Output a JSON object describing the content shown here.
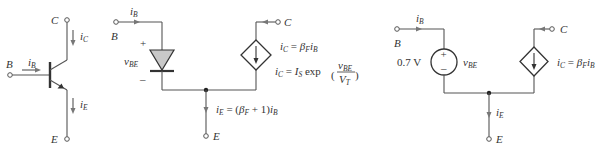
{
  "diagram": {
    "type": "circuit",
    "panels": [
      {
        "id": "transistor",
        "terminals": {
          "base": "B",
          "collector": "C",
          "emitter": "E"
        },
        "currents": {
          "base": {
            "sym": "i",
            "sub": "B"
          },
          "collector": {
            "sym": "i",
            "sub": "C"
          },
          "emitter": {
            "sym": "i",
            "sub": "E"
          }
        }
      },
      {
        "id": "diode-model",
        "terminals": {
          "base": "B",
          "collector": "C",
          "emitter": "E"
        },
        "base_current": {
          "sym": "i",
          "sub": "B"
        },
        "vbe": {
          "sym": "v",
          "sub": "BE",
          "plus": "+",
          "minus": "–"
        },
        "eq1": {
          "lhs": "i",
          "lhs_sub": "C",
          "eq": " = ",
          "beta": "β",
          "beta_sub": "F",
          "rhs": "i",
          "rhs_sub": "B"
        },
        "eq2": {
          "lhs": "i",
          "lhs_sub": "C",
          "eq": " = ",
          "is": "I",
          "is_sub": "S",
          "exp": " exp",
          "num": "v",
          "num_sub": "BE",
          "den": "V",
          "den_sub": "T",
          "lparen": "(",
          "rparen": ")"
        },
        "eq3": {
          "lhs": "i",
          "lhs_sub": "E",
          "eq": " = (",
          "beta": "β",
          "beta_sub": "F",
          "plus1": " + 1)",
          "rhs": "i",
          "rhs_sub": "B"
        }
      },
      {
        "id": "constant-voltage-model",
        "terminals": {
          "base": "B",
          "collector": "C",
          "emitter": "E"
        },
        "base_current": {
          "sym": "i",
          "sub": "B"
        },
        "source_value": "0.7 V",
        "vbe": {
          "sym": "v",
          "sub": "BE",
          "plus": "+",
          "minus": "–"
        },
        "eq1": {
          "lhs": "i",
          "lhs_sub": "C",
          "eq": " = ",
          "beta": "β",
          "beta_sub": "F",
          "rhs": "i",
          "rhs_sub": "B"
        },
        "emitter_current": {
          "sym": "i",
          "sub": "E"
        }
      }
    ]
  }
}
